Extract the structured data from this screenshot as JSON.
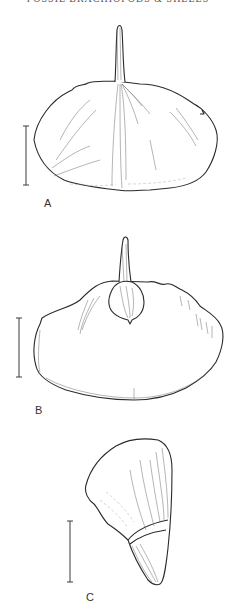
{
  "page": {
    "running_header": "FOSSIL BRACHIOPODS & SHELLS",
    "running_header_note": "cropped at top edge"
  },
  "figure": {
    "panels": [
      {
        "id": "A",
        "label": "A",
        "description": "Dorsal view of shell with long hinge spine"
      },
      {
        "id": "B",
        "label": "B",
        "description": "View of shell with spine and rounded umbonal plate"
      },
      {
        "id": "C",
        "label": "C",
        "description": "Lateral view of conical shell"
      }
    ],
    "scale_bars": [
      {
        "panel": "A",
        "x": 26,
        "y1": 126,
        "y2": 185
      },
      {
        "panel": "B",
        "x": 19,
        "y1": 318,
        "y2": 377
      },
      {
        "panel": "C",
        "x": 70,
        "y1": 521,
        "y2": 582
      }
    ],
    "colors": {
      "ink": "#2a2a2a",
      "paper": "#ffffff"
    }
  }
}
